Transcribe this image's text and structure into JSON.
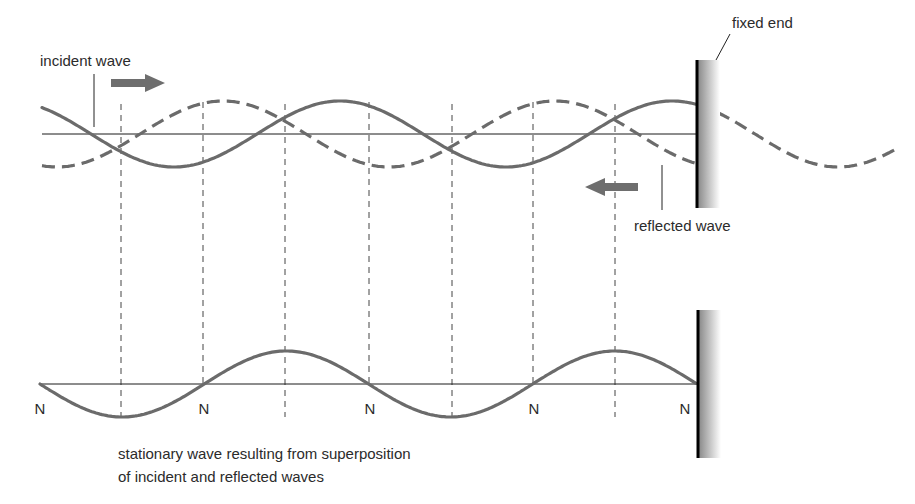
{
  "diagram": {
    "labels": {
      "incident": "incident wave",
      "reflected": "reflected wave",
      "fixed_end": "fixed end",
      "caption_line1": "stationary wave resulting from superposition",
      "caption_line2": "of incident and reflected waves",
      "node": "N"
    },
    "node_labels": [
      "N",
      "N",
      "N",
      "N",
      "N"
    ],
    "colors": {
      "wave": "#6b6b6b",
      "axis": "#1a1a1a",
      "arrow": "#6e6e6e",
      "wall": "#000000"
    },
    "waves": {
      "wavelength_quarter_spacing_count": 7,
      "incident": {
        "style": "solid",
        "direction": "right"
      },
      "reflected": {
        "style": "dashed",
        "direction": "left"
      },
      "incident_continuation_beyond_wall": {
        "style": "dashed"
      },
      "stationary": {
        "style": "solid",
        "nodes": 5,
        "antinodes": 4
      }
    }
  }
}
